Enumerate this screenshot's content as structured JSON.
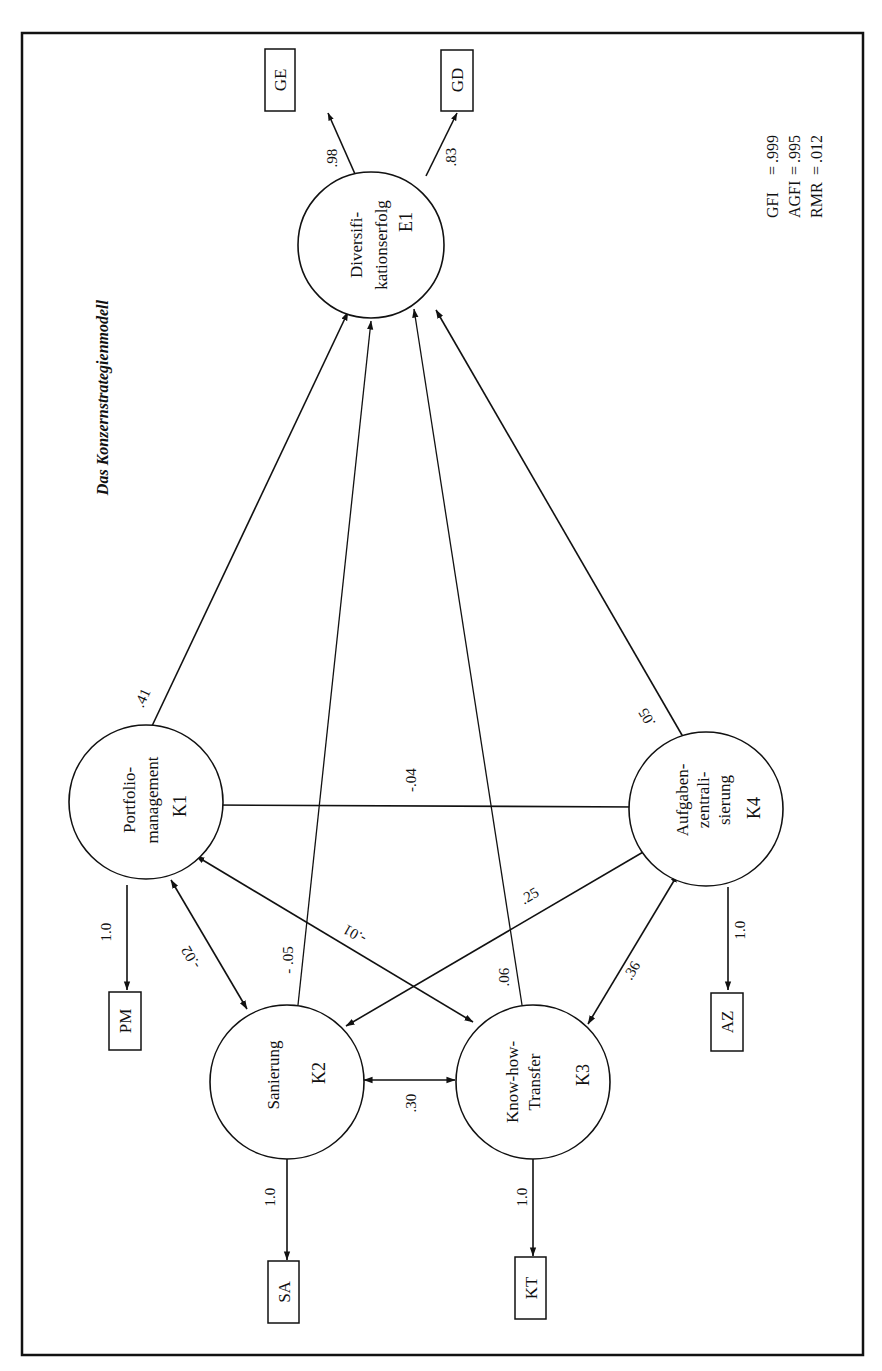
{
  "diagram": {
    "title": "Das Konzernstrategienmodell",
    "type": "structural equation path diagram",
    "orientation": "rotated 90 degrees counter-clockwise",
    "latent_variables": [
      {
        "id": "E1",
        "label_lines": [
          "Diversifi-",
          "kationserfolg"
        ],
        "role": "endogenous"
      },
      {
        "id": "K1",
        "label_lines": [
          "Portfolio-",
          "management"
        ],
        "role": "exogenous"
      },
      {
        "id": "K2",
        "label_lines": [
          "Sanierung"
        ],
        "role": "exogenous"
      },
      {
        "id": "K3",
        "label_lines": [
          "Know-how-",
          "Transfer"
        ],
        "role": "exogenous"
      },
      {
        "id": "K4",
        "label_lines": [
          "Aufgaben-",
          "zentrali-",
          "sierung"
        ],
        "role": "exogenous"
      }
    ],
    "indicators": [
      {
        "id": "GE",
        "of": "E1",
        "loading": ".98"
      },
      {
        "id": "GD",
        "of": "E1",
        "loading": ".83"
      },
      {
        "id": "PM",
        "of": "K1",
        "loading": "1.0"
      },
      {
        "id": "SA",
        "of": "K2",
        "loading": "1.0"
      },
      {
        "id": "KT",
        "of": "K3",
        "loading": "1.0"
      },
      {
        "id": "AZ",
        "of": "K4",
        "loading": "1.0"
      }
    ],
    "paths": [
      {
        "from": "K1",
        "to": "E1",
        "coef": ".41"
      },
      {
        "from": "K2",
        "to": "E1",
        "coef": "- .05"
      },
      {
        "from": "K3",
        "to": "E1",
        "coef": ".06"
      },
      {
        "from": "K4",
        "to": "E1",
        "coef": ".05"
      }
    ],
    "correlations": [
      {
        "a": "K1",
        "b": "K4",
        "coef": "-.04"
      },
      {
        "a": "K1",
        "b": "K2",
        "coef": "-.02"
      },
      {
        "a": "K1",
        "b": "K3",
        "coef": "-.01"
      },
      {
        "a": "K2",
        "b": "K4",
        "coef": ".25"
      },
      {
        "a": "K2",
        "b": "K3",
        "coef": ".30"
      },
      {
        "a": "K3",
        "b": "K4",
        "coef": ".36"
      }
    ],
    "fit_indices": [
      {
        "name": "GFI",
        "eq": "=",
        "value": ".999"
      },
      {
        "name": "AGFI",
        "eq": "=",
        "value": ".995"
      },
      {
        "name": "RMR",
        "eq": "=",
        "value": ".012"
      }
    ]
  }
}
